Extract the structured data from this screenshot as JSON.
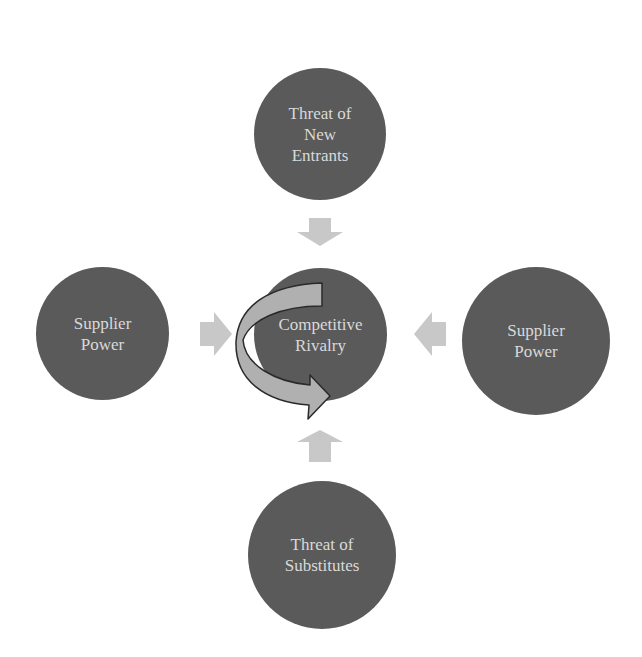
{
  "diagram": {
    "center": {
      "label": "Competitive\nRivalry"
    },
    "forces": [
      {
        "position": "top",
        "label": "Threat of\nNew\nEntrants"
      },
      {
        "position": "left",
        "label": "Supplier\nPower"
      },
      {
        "position": "right",
        "label": "Supplier\nPower"
      },
      {
        "position": "bottom",
        "label": "Threat of\nSubstitutes"
      }
    ],
    "colors": {
      "circle": "#5a5a5a",
      "text": "#d9d9d9",
      "arrow": "#c8c8c8",
      "curved_arrow": "#b0b0b0",
      "curved_arrow_outline": "#2a2a2a"
    }
  }
}
